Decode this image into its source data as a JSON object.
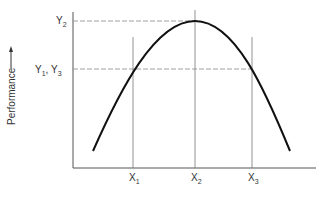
{
  "diagram": {
    "type": "inverted-u curve",
    "y_axis_label": "Performance",
    "y_axis_arrow": "up-arrow",
    "y_ticks": [
      {
        "label": "Y",
        "sub": "2",
        "y": 21
      },
      {
        "label": "Y",
        "sub": "1",
        "label2": ", Y",
        "sub2": "3",
        "y": 69
      }
    ],
    "x_ticks": [
      {
        "label": "X",
        "sub": "1",
        "x": 133
      },
      {
        "label": "X",
        "sub": "2",
        "x": 195
      },
      {
        "label": "X",
        "sub": "3",
        "x": 252
      }
    ],
    "curve": {
      "start": [
        93,
        151
      ],
      "peak": [
        195,
        21
      ],
      "end": [
        290,
        151
      ]
    },
    "colors": {
      "curve": "#111111",
      "axis": "#555555",
      "guide": "#777777",
      "dash": "#888888"
    }
  },
  "labels": {
    "y_label": "Performance",
    "y2": "Y",
    "y2_sub": "2",
    "y13_a": "Y",
    "y13_a_sub": "1",
    "y13_sep": ", Y",
    "y13_b_sub": "3",
    "x1": "X",
    "x1_sub": "1",
    "x2": "X",
    "x2_sub": "2",
    "x3": "X",
    "x3_sub": "3"
  }
}
